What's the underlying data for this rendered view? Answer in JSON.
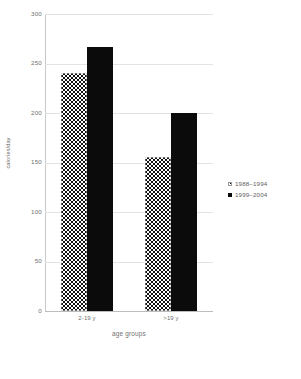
{
  "chart_data": {
    "type": "bar",
    "title": "",
    "xlabel": "age groups",
    "ylabel": "calories/day",
    "categories": [
      "2-19 y",
      ">19 y"
    ],
    "series": [
      {
        "name": "1988–1994",
        "values": [
          240,
          156
        ],
        "pattern": "checker"
      },
      {
        "name": "1999–2004",
        "values": [
          267,
          200
        ],
        "pattern": "solid"
      }
    ],
    "ylim": [
      0,
      300
    ],
    "yticks": [
      0,
      50,
      100,
      150,
      200,
      250,
      300
    ],
    "ytick_labels": [
      "0",
      "50",
      "100",
      "150",
      "200",
      "250",
      "300"
    ],
    "grid": true,
    "legend_position": "right",
    "colors": {
      "solid": "#0b0b0b",
      "pattern_ink": "#111111",
      "gridline": "#e3e3e3",
      "axis": "#c9c9c9",
      "text": "#6f6f6f"
    }
  },
  "axes": {
    "y_title": "calories/day",
    "x_title": "age groups"
  },
  "legend": {
    "items": [
      {
        "label": "1988–1994",
        "swatch": "checker-swatch"
      },
      {
        "label": "1999–2004",
        "swatch": "solid-swatch"
      }
    ]
  }
}
